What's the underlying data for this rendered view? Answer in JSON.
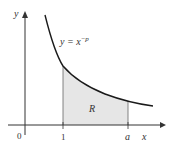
{
  "diagram": {
    "curve_label_base": "y = x",
    "curve_label_exp": "−p",
    "region_label": "R",
    "x_axis_label": "x",
    "y_axis_label": "y",
    "ticks": {
      "origin": "0",
      "one": "1",
      "a": "a"
    },
    "colors": {
      "curve": "#1a1a1a",
      "region_fill": "#e6e6e6",
      "axis": "#333333"
    }
  }
}
